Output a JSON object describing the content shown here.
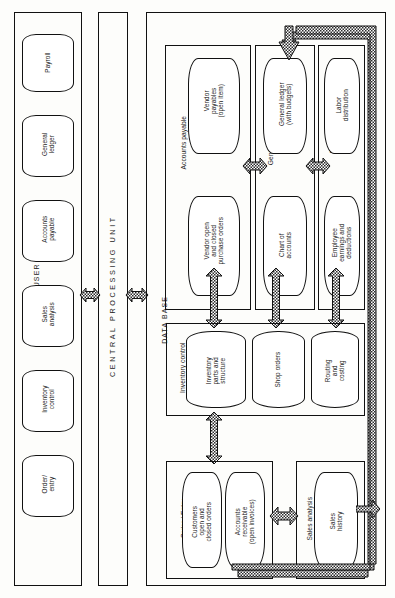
{
  "diagram": {
    "sections": [
      {
        "id": "user-terminals",
        "label": "USER TERMINALS"
      },
      {
        "id": "central-processing-unit",
        "label": "CENTRAL PROCESSING UNIT"
      },
      {
        "id": "data-base",
        "label": "DATA BASE"
      }
    ]
  },
  "terminals": [
    {
      "id": "order-entry",
      "lines": [
        "Order/",
        "entry"
      ]
    },
    {
      "id": "inventory-control",
      "lines": [
        "Inventory",
        "control"
      ]
    },
    {
      "id": "sales-analysis",
      "lines": [
        "Sales",
        "analysis"
      ]
    },
    {
      "id": "accounts-payable",
      "lines": [
        "Accounts",
        "payable"
      ]
    },
    {
      "id": "general-ledger",
      "lines": [
        "General",
        "ledger"
      ]
    },
    {
      "id": "payroll",
      "lines": [
        "Payroll"
      ]
    }
  ],
  "database_groups": [
    {
      "id": "accounts-payable",
      "label": "Accounts payable",
      "nodes": [
        {
          "id": "vendor-payables",
          "lines": [
            "Vendor",
            "payables",
            "(open item)"
          ]
        },
        {
          "id": "vendor-purchase-orders",
          "lines": [
            "Vendor  open",
            "and closed",
            "purchase orders"
          ]
        }
      ]
    },
    {
      "id": "general-ledger",
      "label": "General ledger",
      "nodes": [
        {
          "id": "general-ledger-budgets",
          "lines": [
            "General ledger",
            "(with budgets)"
          ]
        },
        {
          "id": "chart-of-accounts",
          "lines": [
            "Chart of",
            "accounts"
          ]
        }
      ]
    },
    {
      "id": "payroll",
      "label": "Payroll",
      "nodes": [
        {
          "id": "labor-distribution",
          "lines": [
            "Labor",
            "distribution"
          ]
        },
        {
          "id": "employee-earnings",
          "lines": [
            "Employee",
            "earnings and",
            "deductions"
          ]
        }
      ]
    },
    {
      "id": "inventory-control",
      "label": "Inventory control",
      "nodes": [
        {
          "id": "inventory-parts",
          "lines": [
            "Inventory",
            "parts and",
            "structure"
          ]
        },
        {
          "id": "shop-orders",
          "lines": [
            "Shop orders"
          ]
        },
        {
          "id": "routing-and-costing",
          "lines": [
            "Routing",
            "and",
            "costing"
          ]
        }
      ]
    },
    {
      "id": "order-entry",
      "label": "Order / Entry",
      "nodes": [
        {
          "id": "customers-orders",
          "lines": [
            "Customers",
            "open and",
            "closed orders"
          ]
        },
        {
          "id": "accounts-receivable",
          "lines": [
            "Accounts",
            "receivable",
            "(open invoices)"
          ]
        }
      ]
    },
    {
      "id": "sales-analysis",
      "label": "Sales analysis",
      "nodes": [
        {
          "id": "sales-history",
          "lines": [
            "Sales",
            "history"
          ]
        }
      ]
    }
  ],
  "colors": {
    "line": "#111111",
    "hatch": "#2b2b2b",
    "background": "#fdfdfb"
  }
}
